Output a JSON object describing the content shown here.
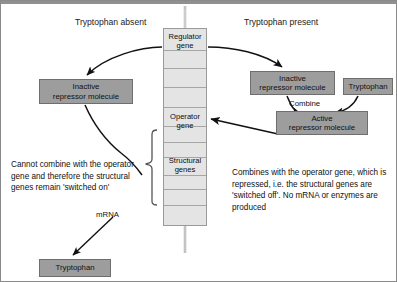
{
  "page": {
    "running_header": "UNIT 11B  THE GENETIC CODE",
    "width": 397,
    "height": 282
  },
  "columns": {
    "left_title": "Tryptophan absent",
    "right_title": "Tryptophan present"
  },
  "gene_column": {
    "regulator_label": "Regulator\ngene",
    "regulator_line1": "Regulator",
    "regulator_line2": "gene",
    "operator_line1": "Operator",
    "operator_line2": "gene",
    "structural_line1": "Structural",
    "structural_line2": "genes"
  },
  "boxes": {
    "inactive_left_line1": "Inactive",
    "inactive_left_line2": "repressor molecule",
    "inactive_right_line1": "Inactive",
    "inactive_right_line2": "repressor molecule",
    "tryptophan_right": "Tryptophan",
    "active_right_line1": "Active",
    "active_right_line2": "repressor molecule",
    "tryptophan_bottom": "Tryptophan"
  },
  "labels": {
    "combine": "Combine",
    "mrna": "mRNA"
  },
  "notes": {
    "left": "Cannot combine with the operator gene and therefore the structural genes remain 'switched on'",
    "right": "Combines with the operator gene, which is repressed, i.e. the structural genes are 'switched off'. No mRNA or enzymes are produced"
  },
  "colors": {
    "box_fill": "#9d9d9d",
    "box_stroke": "#6e6e6e",
    "column_fill": "#e4e4e4",
    "column_stroke": "#9a9a9a",
    "arrow": "#111111",
    "text": "#101010",
    "header_rule": "#909090"
  }
}
